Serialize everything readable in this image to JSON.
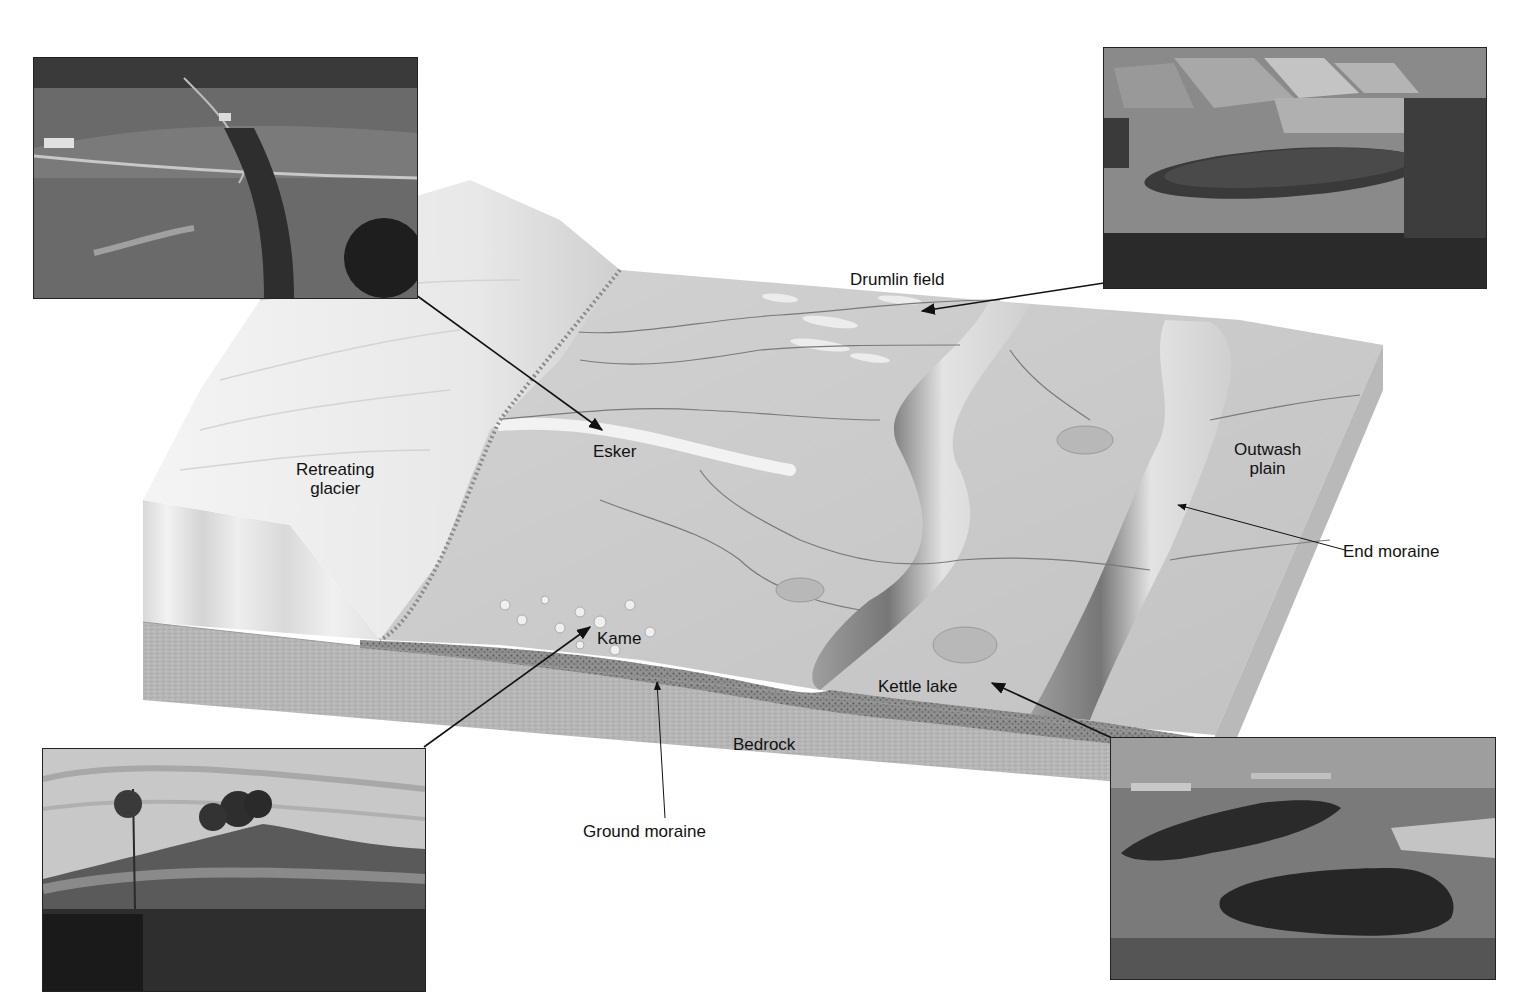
{
  "diagram": {
    "type": "glacial-landforms-block-diagram",
    "colors": {
      "background": "#ffffff",
      "glacier": "#eeeeee",
      "plain": "#c9c9c9",
      "bedrock": "#b4b4b4",
      "ground_moraine": "#8a8a8a",
      "label_text": "#111111",
      "leader_line": "#111111"
    }
  },
  "labels": {
    "drumlin_field": "Drumlin field",
    "retreating_glacier_line1": "Retreating",
    "retreating_glacier_line2": "glacier",
    "esker": "Esker",
    "outwash_plain_line1": "Outwash",
    "outwash_plain_line2": "plain",
    "end_moraine": "End moraine",
    "kame": "Kame",
    "kettle_lake": "Kettle lake",
    "bedrock": "Bedrock",
    "ground_moraine": "Ground moraine"
  },
  "photos": [
    {
      "id": "esker-photo",
      "subject": "Esker",
      "caption": ""
    },
    {
      "id": "drumlin-photo",
      "subject": "Drumlin field",
      "caption": ""
    },
    {
      "id": "kame-photo",
      "subject": "Kame",
      "caption": ""
    },
    {
      "id": "kettle-lake-photo",
      "subject": "Kettle lake",
      "caption": ""
    }
  ]
}
